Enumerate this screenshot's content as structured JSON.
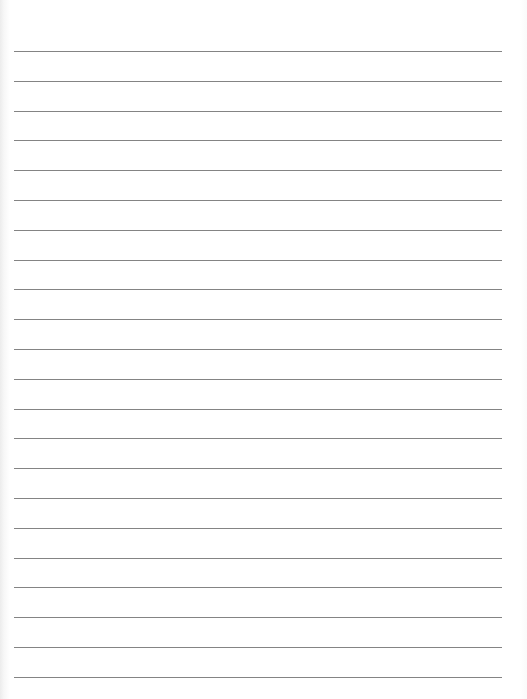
{
  "page": {
    "type": "blank lined writing paper",
    "line_count": 22,
    "line_color": "#6e6e6e",
    "background_color": "#ffffff",
    "line_left_px": 14,
    "line_right_px": 502,
    "first_line_y_px": 51,
    "line_spacing_px": 29.8
  }
}
